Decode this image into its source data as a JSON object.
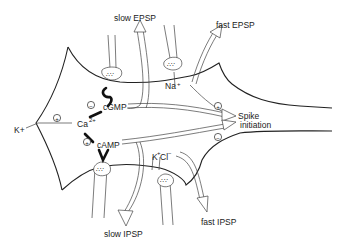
{
  "diagram": {
    "labels": {
      "slow_epsp": "slow EPSP",
      "fast_epsp": "fast EPSP",
      "slow_ipsp": "slow IPSP",
      "fast_ipsp": "fast IPSP",
      "spike_line1": "Spike",
      "spike_line2": "initiation",
      "cgmp": "cGMP",
      "camp": "cAMP",
      "calcium": "Ca",
      "calcium_charge": "2+",
      "potassium_left": "K+",
      "sodium": "Na",
      "sodium_charge": "+",
      "k_ion": "K",
      "k_charge": "+",
      "cl_ion": "Cl",
      "cl_charge": "−"
    },
    "signs": {
      "plus": "+",
      "minus": "−"
    },
    "signs_placement": [
      {
        "near": "cGMP to Ca2+",
        "sign": "minus"
      },
      {
        "near": "Ca2+ to K+",
        "sign": "plus"
      },
      {
        "near": "cAMP to Ca2+",
        "sign": "plus"
      },
      {
        "near": "fast EPSP to Spike initiation",
        "sign": "plus"
      },
      {
        "near": "fast IPSP to Spike initiation",
        "sign": "minus"
      }
    ]
  }
}
